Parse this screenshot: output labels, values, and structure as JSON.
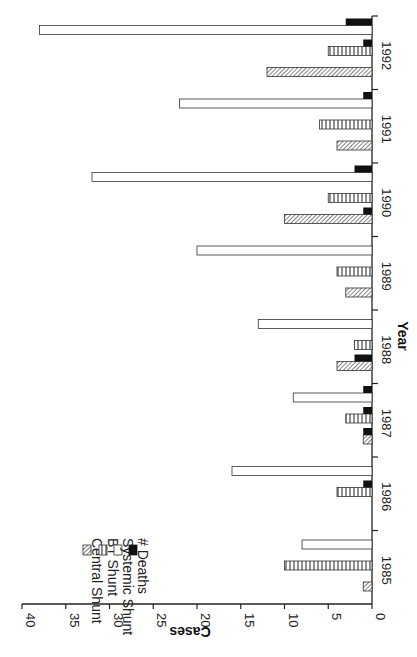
{
  "chart_data": {
    "type": "bar",
    "orientation": "rotated-90-clockwise",
    "title": "",
    "xlabel": "Year",
    "ylabel": "Cases",
    "ylim": [
      0,
      40
    ],
    "yticks": [
      0,
      5,
      10,
      15,
      20,
      25,
      30,
      35,
      40
    ],
    "grid": false,
    "legend_position": "upper-left (rotated)",
    "categories": [
      "1985",
      "1986",
      "1987",
      "1988",
      "1989",
      "1990",
      "1991",
      "1992"
    ],
    "series": [
      {
        "name": "Central Shunt",
        "pattern": "diagonal-hatch",
        "values": [
          1,
          0,
          1,
          4,
          3,
          10,
          4,
          12
        ]
      },
      {
        "name": "BT Shunt",
        "pattern": "vertical-stripes",
        "values": [
          10,
          4,
          3,
          2,
          4,
          5,
          6,
          5
        ]
      },
      {
        "name": "Systemic Shunt",
        "pattern": "white",
        "values": [
          8,
          16,
          9,
          13,
          20,
          32,
          22,
          38
        ]
      },
      {
        "name": "# Deaths",
        "pattern": "black",
        "values": [
          0,
          1,
          3,
          2,
          0,
          3,
          1,
          4
        ]
      }
    ],
    "deaths_detail": {
      "1986": {
        "BT Shunt": 1
      },
      "1987": {
        "Central Shunt": 1,
        "BT Shunt": 1,
        "Systemic Shunt": 1
      },
      "1988": {
        "Central Shunt": 2
      },
      "1990": {
        "Central Shunt": 1,
        "Systemic Shunt": 2
      },
      "1991": {
        "Systemic Shunt": 1
      },
      "1992": {
        "BT Shunt": 1,
        "Systemic Shunt": 3
      }
    }
  },
  "legend": {
    "items": [
      {
        "label": "Central Shunt"
      },
      {
        "label": "BT Shunt"
      },
      {
        "label": "Systemic Shunt"
      },
      {
        "label": "# Deaths"
      }
    ]
  },
  "axes": {
    "x_title": "Year",
    "y_title": "Cases",
    "y_ticks": [
      "0",
      "5",
      "10",
      "15",
      "20",
      "25",
      "30",
      "35",
      "40"
    ],
    "x_ticks": [
      "1985",
      "1986",
      "1987",
      "1988",
      "1989",
      "1990",
      "1991",
      "1992"
    ]
  }
}
